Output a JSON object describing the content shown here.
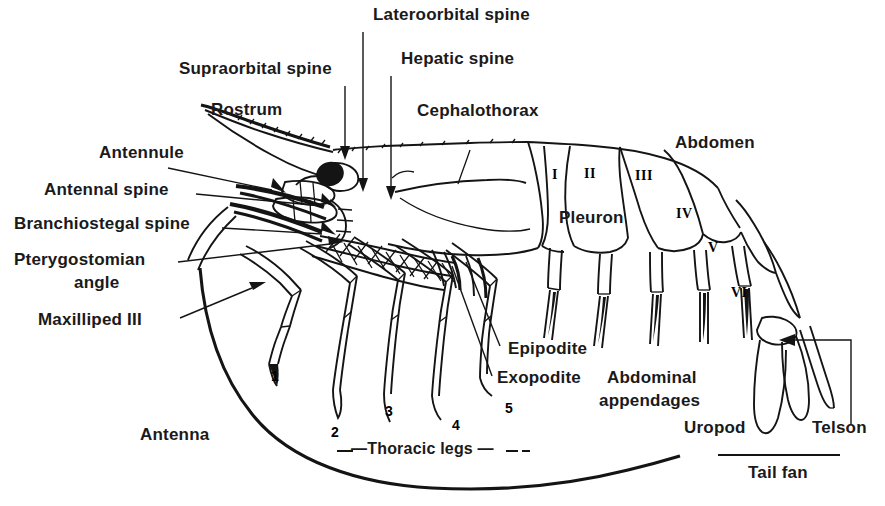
{
  "figure": {
    "background_color": "#ffffff",
    "ink_color": "#141414",
    "width": 885,
    "height": 506
  },
  "labels": {
    "lateroorbital_spine": "Lateroorbital spine",
    "hepatic_spine": "Hepatic spine",
    "supraorbital_spine": "Supraorbital spine",
    "rostrum": "Rostrum",
    "cephalothorax": "Cephalothorax",
    "abdomen": "Abdomen",
    "antennule": "Antennule",
    "antennal_spine": "Antennal spine",
    "branchiostegal_spine": "Branchiostegal spine",
    "pterygostomian_angle_line1": "Pterygostomian",
    "pterygostomian_angle_line2": "angle",
    "maxilliped_iii": "Maxilliped III",
    "pleuron": "Pleuron",
    "epipodite": "Epipodite",
    "exopodite": "Exopodite",
    "abdominal_appendages_line1": "Abdominal",
    "abdominal_appendages_line2": "appendages",
    "uropod": "Uropod",
    "telson": "Telson",
    "tail_fan": "Tail fan",
    "antenna": "Antenna",
    "thoracic_legs": "—Thoracic legs —"
  },
  "thoracic_leg_numbers": [
    "1",
    "2",
    "3",
    "4",
    "5"
  ],
  "abdominal_segment_numerals": [
    "I",
    "II",
    "III",
    "IV",
    "V",
    "VI"
  ]
}
